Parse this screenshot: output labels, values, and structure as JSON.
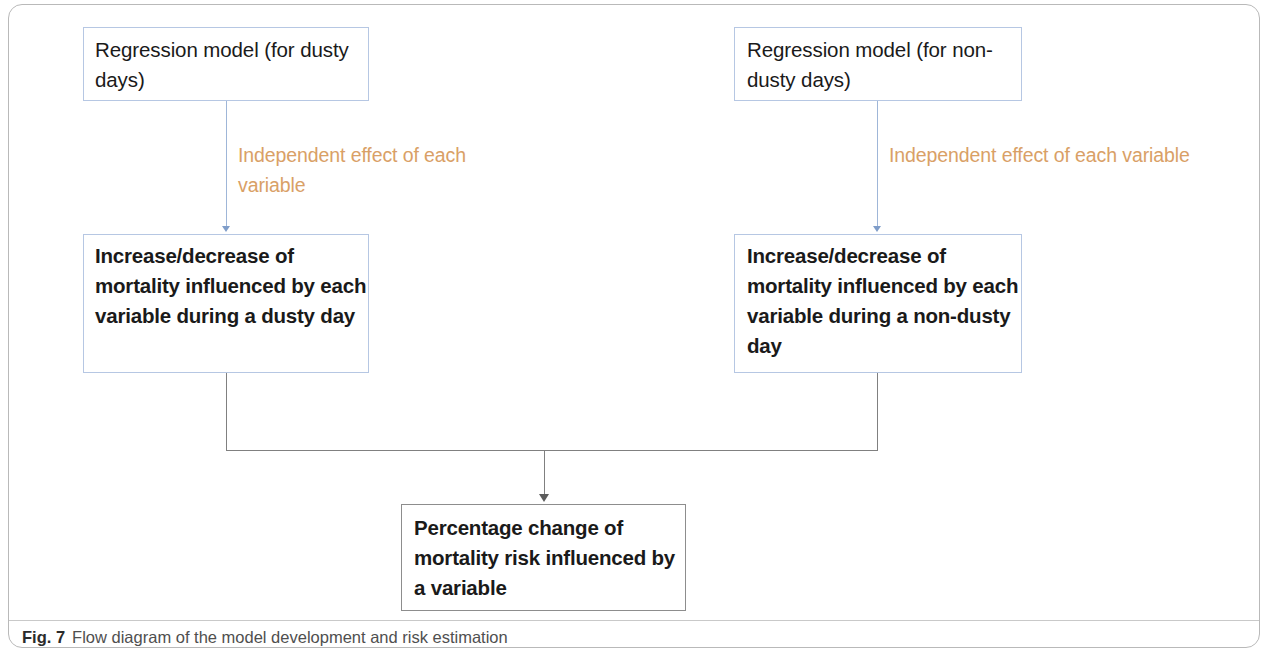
{
  "figure": {
    "caption_label": "Fig. 7",
    "caption_text": "Flow diagram of the model development and risk estimation"
  },
  "colors": {
    "box_border_blue": "#b6c7e3",
    "box_border_gray": "#8d8d8d",
    "annotation_orange": "#d9a066",
    "connector_blue": "#9fb6d8",
    "connector_gray": "#808080",
    "frame": "#b9b9b9",
    "text": "#1a1a1a"
  },
  "nodes": {
    "top_left": "Regression model (for dusty days)",
    "top_right": "Regression model (for non-dusty days)",
    "mid_left": "Increase/decrease of mortality influenced by each variable during a dusty day",
    "mid_right": "Increase/decrease of mortality influenced by each variable during a non-dusty day",
    "bottom": "Percentage change of mortality risk influenced by a variable"
  },
  "annotations": {
    "left": "Independent effect of each variable",
    "right": "Independent effect of each variable"
  }
}
